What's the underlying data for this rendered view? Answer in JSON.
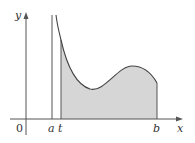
{
  "figure": {
    "type": "improper-integral-area-diagram",
    "labels": {
      "y_axis": "y",
      "x_axis": "x",
      "origin": "0",
      "a": "a",
      "t": "t",
      "b": "b"
    },
    "colors": {
      "axis": "#555555",
      "curve": "#444444",
      "fill": "#d6d6d6",
      "lines": "#555555"
    }
  }
}
